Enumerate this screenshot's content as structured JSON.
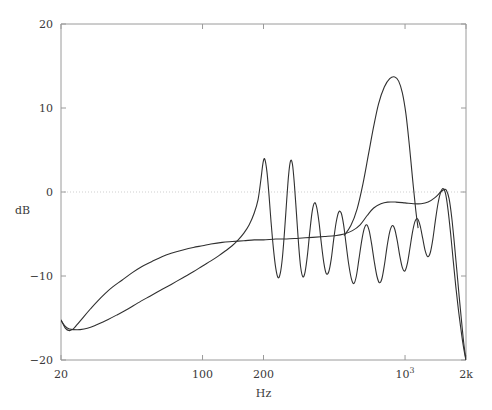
{
  "chart_data": {
    "type": "line",
    "title": "",
    "subtitle": "",
    "xlabel": "Hz",
    "ylabel": "dB",
    "xscale": "log",
    "xlim": [
      20,
      2000
    ],
    "ylim": [
      -20,
      20
    ],
    "grid": false,
    "zero_line": true,
    "legend": "none",
    "yticks": [
      {
        "value": 20,
        "label": "20"
      },
      {
        "value": 10,
        "label": "10"
      },
      {
        "value": 0,
        "label": "0"
      },
      {
        "value": -10,
        "label": "−10"
      },
      {
        "value": -20,
        "label": "−20"
      }
    ],
    "xticks": [
      {
        "value": 20,
        "label": "20",
        "html": "20"
      },
      {
        "value": 100,
        "label": "100",
        "html": "100"
      },
      {
        "value": 200,
        "label": "200",
        "html": "200"
      },
      {
        "value": 1000,
        "label": "10^3",
        "html": "10<sup>3</sup>"
      },
      {
        "value": 2000,
        "label": "2k",
        "html": "2k"
      }
    ],
    "series": [
      {
        "name": "smooth-response",
        "style": "solid",
        "color": "#303030",
        "points": [
          [
            20,
            -15.2
          ],
          [
            21,
            -16.2
          ],
          [
            22,
            -16.5
          ],
          [
            23,
            -16.3
          ],
          [
            24,
            -15.8
          ],
          [
            26,
            -14.8
          ],
          [
            28,
            -13.9
          ],
          [
            30,
            -13.1
          ],
          [
            33,
            -12.1
          ],
          [
            36,
            -11.3
          ],
          [
            40,
            -10.5
          ],
          [
            45,
            -9.6
          ],
          [
            50,
            -8.9
          ],
          [
            56,
            -8.3
          ],
          [
            63,
            -7.7
          ],
          [
            70,
            -7.3
          ],
          [
            80,
            -6.9
          ],
          [
            90,
            -6.6
          ],
          [
            100,
            -6.4
          ],
          [
            110,
            -6.2
          ],
          [
            125,
            -6.0
          ],
          [
            140,
            -5.9
          ],
          [
            160,
            -5.8
          ],
          [
            180,
            -5.7
          ],
          [
            200,
            -5.7
          ],
          [
            230,
            -5.6
          ],
          [
            260,
            -5.6
          ],
          [
            300,
            -5.5
          ],
          [
            350,
            -5.4
          ],
          [
            400,
            -5.3
          ],
          [
            450,
            -5.2
          ],
          [
            500,
            -5.0
          ],
          [
            550,
            -4.6
          ],
          [
            600,
            -3.9
          ],
          [
            650,
            -2.8
          ],
          [
            700,
            -1.9
          ],
          [
            760,
            -1.4
          ],
          [
            820,
            -1.2
          ],
          [
            900,
            -1.2
          ],
          [
            1000,
            -1.3
          ],
          [
            1100,
            -1.4
          ],
          [
            1200,
            -1.4
          ],
          [
            1300,
            -1.2
          ],
          [
            1400,
            -0.7
          ],
          [
            1500,
            0.0
          ],
          [
            1560,
            0.3
          ],
          [
            1600,
            0.2
          ],
          [
            1650,
            -0.8
          ],
          [
            1700,
            -3.0
          ],
          [
            1750,
            -6.0
          ],
          [
            1800,
            -9.2
          ],
          [
            1850,
            -12.4
          ],
          [
            1900,
            -15.3
          ],
          [
            1950,
            -18.0
          ],
          [
            2000,
            -20.0
          ]
        ]
      },
      {
        "name": "resonant-response",
        "style": "solid",
        "color": "#303030",
        "points": [
          [
            20,
            -15.3
          ],
          [
            21,
            -16.0
          ],
          [
            22,
            -16.3
          ],
          [
            24,
            -16.4
          ],
          [
            26,
            -16.3
          ],
          [
            28,
            -16.1
          ],
          [
            30,
            -15.8
          ],
          [
            34,
            -15.2
          ],
          [
            38,
            -14.6
          ],
          [
            43,
            -13.9
          ],
          [
            48,
            -13.2
          ],
          [
            55,
            -12.4
          ],
          [
            62,
            -11.7
          ],
          [
            70,
            -11.0
          ],
          [
            80,
            -10.2
          ],
          [
            90,
            -9.5
          ],
          [
            100,
            -8.8
          ],
          [
            110,
            -8.2
          ],
          [
            120,
            -7.6
          ],
          [
            130,
            -7.0
          ],
          [
            140,
            -6.4
          ],
          [
            150,
            -5.7
          ],
          [
            160,
            -4.9
          ],
          [
            170,
            -3.9
          ],
          [
            180,
            -2.5
          ],
          [
            188,
            -0.9
          ],
          [
            194,
            1.4
          ],
          [
            199,
            3.5
          ],
          [
            203,
            3.9
          ],
          [
            208,
            2.4
          ],
          [
            213,
            -0.4
          ],
          [
            218,
            -3.6
          ],
          [
            224,
            -6.8
          ],
          [
            230,
            -9.1
          ],
          [
            236,
            -10.2
          ],
          [
            242,
            -9.7
          ],
          [
            248,
            -7.8
          ],
          [
            254,
            -4.7
          ],
          [
            260,
            -1.2
          ],
          [
            266,
            2.0
          ],
          [
            272,
            3.7
          ],
          [
            278,
            3.3
          ],
          [
            284,
            1.0
          ],
          [
            291,
            -2.6
          ],
          [
            298,
            -6.2
          ],
          [
            305,
            -8.9
          ],
          [
            313,
            -10.1
          ],
          [
            321,
            -9.5
          ],
          [
            330,
            -7.4
          ],
          [
            339,
            -4.6
          ],
          [
            348,
            -2.3
          ],
          [
            357,
            -1.3
          ],
          [
            366,
            -1.8
          ],
          [
            376,
            -3.6
          ],
          [
            386,
            -6.1
          ],
          [
            397,
            -8.4
          ],
          [
            408,
            -9.7
          ],
          [
            420,
            -9.5
          ],
          [
            432,
            -8.0
          ],
          [
            444,
            -5.7
          ],
          [
            457,
            -3.6
          ],
          [
            470,
            -2.4
          ],
          [
            484,
            -2.5
          ],
          [
            498,
            -4.0
          ],
          [
            512,
            -6.3
          ],
          [
            527,
            -8.6
          ],
          [
            543,
            -10.3
          ],
          [
            559,
            -10.9
          ],
          [
            575,
            -10.0
          ],
          [
            592,
            -8.0
          ],
          [
            610,
            -5.9
          ],
          [
            628,
            -4.4
          ],
          [
            646,
            -3.9
          ],
          [
            665,
            -4.6
          ],
          [
            685,
            -6.3
          ],
          [
            705,
            -8.3
          ],
          [
            726,
            -10.0
          ],
          [
            747,
            -10.8
          ],
          [
            769,
            -10.3
          ],
          [
            792,
            -8.6
          ],
          [
            815,
            -6.5
          ],
          [
            839,
            -4.8
          ],
          [
            864,
            -4.0
          ],
          [
            889,
            -4.4
          ],
          [
            915,
            -5.8
          ],
          [
            942,
            -7.6
          ],
          [
            970,
            -9.0
          ],
          [
            998,
            -9.4
          ],
          [
            1027,
            -8.5
          ],
          [
            1057,
            -6.7
          ],
          [
            1088,
            -4.8
          ],
          [
            1120,
            -3.5
          ],
          [
            1153,
            -3.2
          ],
          [
            1187,
            -4.0
          ],
          [
            1222,
            -5.5
          ],
          [
            1258,
            -7.0
          ],
          [
            1295,
            -7.7
          ],
          [
            1333,
            -7.2
          ],
          [
            1372,
            -5.6
          ],
          [
            1412,
            -3.4
          ],
          [
            1454,
            -1.4
          ],
          [
            1496,
            -0.1
          ],
          [
            1540,
            0.4
          ],
          [
            1585,
            -0.2
          ],
          [
            1630,
            -2.1
          ],
          [
            1680,
            -5.0
          ],
          [
            1730,
            -8.2
          ],
          [
            1780,
            -11.2
          ],
          [
            1830,
            -13.8
          ],
          [
            1880,
            -16.0
          ],
          [
            1930,
            -18.0
          ],
          [
            1975,
            -19.4
          ],
          [
            2000,
            -20.0
          ]
        ]
      }
    ],
    "annotations": {
      "peak_200hz_db": 3.9,
      "peak_270hz_db": 3.7,
      "peak_900hz_db": 13.7,
      "low_freq_min_db": -16.5,
      "plateau_db": -5.6
    },
    "extra_series": [
      {
        "name": "resonant-high-peak",
        "comment": "broad peak region overlay 600-1200 Hz",
        "points": [
          [
            500,
            -5.2
          ],
          [
            540,
            -4.0
          ],
          [
            580,
            -2.0
          ],
          [
            620,
            1.0
          ],
          [
            660,
            4.5
          ],
          [
            700,
            7.8
          ],
          [
            740,
            10.5
          ],
          [
            790,
            12.5
          ],
          [
            840,
            13.5
          ],
          [
            890,
            13.7
          ],
          [
            930,
            13.2
          ],
          [
            970,
            11.8
          ],
          [
            1010,
            9.3
          ],
          [
            1050,
            5.6
          ],
          [
            1090,
            1.5
          ],
          [
            1130,
            -2.2
          ],
          [
            1160,
            -4.3
          ]
        ]
      }
    ]
  },
  "plot_geometry": {
    "left_px": 61,
    "right_px": 466,
    "top_px": 24,
    "bottom_px": 360
  },
  "style": {
    "axis_color": "#9a9a9a",
    "curve_color": "#303030",
    "zero_line_color": "#cfcfcf",
    "text_color": "#3a3a3a",
    "background": "#ffffff"
  }
}
